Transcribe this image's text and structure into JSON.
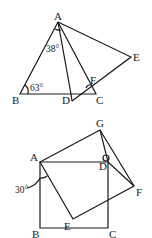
{
  "figure1": {
    "points": {
      "A": "A",
      "B": "B",
      "C": "C",
      "D": "D",
      "E": "E",
      "F": "F"
    },
    "angles": {
      "B": "63°",
      "BAD": "38°"
    }
  },
  "figure2": {
    "points": {
      "A": "A",
      "B": "B",
      "C": "C",
      "D": "D",
      "E": "E",
      "F": "F",
      "G": "G"
    },
    "angles": {
      "BAE": "30°"
    }
  }
}
